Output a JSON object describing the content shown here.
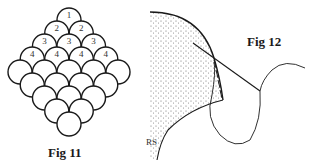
{
  "figures": [
    {
      "id": "fig11",
      "caption": "Fig 11",
      "description": "Diamond arrangement of overlapping circles",
      "rows": [
        {
          "count": 1,
          "label": "1"
        },
        {
          "count": 2,
          "label": "2"
        },
        {
          "count": 3,
          "label": "3"
        },
        {
          "count": 4,
          "label": "4"
        },
        {
          "count": 5,
          "label": ""
        },
        {
          "count": 4,
          "label": ""
        },
        {
          "count": 3,
          "label": ""
        },
        {
          "count": 2,
          "label": ""
        },
        {
          "count": 1,
          "label": ""
        }
      ]
    },
    {
      "id": "fig12",
      "caption": "Fig 12",
      "edge_label": "RS"
    }
  ],
  "colors": {
    "ink": "#1a1a1a",
    "stipple": "#555555",
    "background": "#ffffff"
  }
}
